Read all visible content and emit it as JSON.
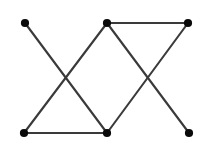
{
  "figure": {
    "kind": "undirected-graph-drawing",
    "title": "",
    "background_color": "#ffffff",
    "width": 200,
    "height": 157,
    "vertex_color": "#0a0a0a",
    "vertex_radius": 4.1,
    "edge_color": "#3a3a3a",
    "edge_width": 2.1,
    "vertex_count": 6,
    "edge_count": 7,
    "crossing_count": 2
  },
  "chart_data": {
    "type": "scatter",
    "title": "",
    "xlabel": "",
    "ylabel": "",
    "grid": false,
    "legend": null,
    "xlim": [
      0,
      200
    ],
    "ylim": [
      0,
      157
    ],
    "vertices": [
      {
        "id": "TL",
        "label": "",
        "x": 25,
        "y": 23,
        "degree": 1
      },
      {
        "id": "TM",
        "label": "",
        "x": 107,
        "y": 23,
        "degree": 3
      },
      {
        "id": "TR",
        "label": "",
        "x": 188,
        "y": 23,
        "degree": 2
      },
      {
        "id": "BL",
        "label": "",
        "x": 24,
        "y": 133,
        "degree": 2
      },
      {
        "id": "BM",
        "label": "",
        "x": 107,
        "y": 133,
        "degree": 3
      },
      {
        "id": "BR",
        "label": "",
        "x": 189,
        "y": 133,
        "degree": 1
      }
    ],
    "edges": [
      {
        "id": "e1",
        "from": "TL",
        "to": "BM"
      },
      {
        "id": "e2",
        "from": "TM",
        "to": "BL"
      },
      {
        "id": "e3",
        "from": "TM",
        "to": "TR"
      },
      {
        "id": "e4",
        "from": "TM",
        "to": "BR"
      },
      {
        "id": "e5",
        "from": "TR",
        "to": "BM"
      },
      {
        "id": "e6",
        "from": "BL",
        "to": "BM"
      }
    ],
    "crossings": [
      {
        "id": "x1",
        "x": 66,
        "y": 78,
        "edges": [
          "e1",
          "e2"
        ]
      },
      {
        "id": "x2",
        "x": 148,
        "y": 78,
        "edges": [
          "e4",
          "e5"
        ]
      }
    ]
  }
}
